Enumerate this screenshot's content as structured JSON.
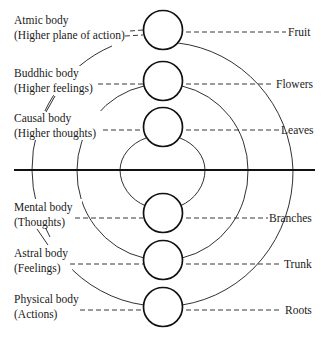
{
  "diagram": {
    "type": "concentric-bodies-tree-analogy",
    "center_x": 163,
    "divider_y": 170,
    "circle_radius": 20,
    "colors": {
      "line": "#1a1a1a",
      "background": "#ffffff",
      "text": "#1a1a1a"
    },
    "bodies": [
      {
        "id": "atmic",
        "name": "Atmic body",
        "description": "(Higher plane of action)",
        "tree_part": "Fruit",
        "cy": 30
      },
      {
        "id": "buddhic",
        "name": "Buddhic body",
        "description": "(Higher feelings)",
        "tree_part": "Flowers",
        "cy": 81
      },
      {
        "id": "causal",
        "name": "Causal body",
        "description": "(Higher thoughts)",
        "tree_part": "Leaves",
        "cy": 127
      },
      {
        "id": "mental",
        "name": "Mental body",
        "description": "(Thoughts)",
        "tree_part": "Branches",
        "cy": 213
      },
      {
        "id": "astral",
        "name": "Astral body",
        "description": "(Feelings)",
        "tree_part": "Trunk",
        "cy": 260
      },
      {
        "id": "physical",
        "name": "Physical body",
        "description": "(Actions)",
        "tree_part": "Roots",
        "cy": 307
      }
    ],
    "connections": [
      {
        "from": "atmic",
        "to": "physical",
        "shape": "outer-arc"
      },
      {
        "from": "buddhic",
        "to": "astral",
        "shape": "middle-arc"
      },
      {
        "from": "causal",
        "to": "mental",
        "shape": "inner-arc"
      }
    ]
  }
}
